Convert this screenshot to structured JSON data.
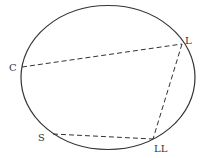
{
  "diagram": {
    "ellipse": {
      "cx": 108,
      "cy": 77.5,
      "rx": 87,
      "ry": 72,
      "stroke": "#333333"
    },
    "points": [
      {
        "id": "C",
        "label": "C",
        "x": 22,
        "y": 67,
        "label_x": 9,
        "label_y": 71
      },
      {
        "id": "L",
        "label": "L",
        "x": 182,
        "y": 44,
        "label_x": 185,
        "label_y": 44
      },
      {
        "id": "S",
        "label": "S",
        "x": 53,
        "y": 134,
        "label_x": 38,
        "label_y": 141
      },
      {
        "id": "LL",
        "label": "LL",
        "x": 153,
        "y": 139,
        "label_x": 154,
        "label_y": 152
      }
    ],
    "dashed_lines": [
      {
        "from": "C",
        "to": "L"
      },
      {
        "from": "L",
        "to": "LL"
      },
      {
        "from": "S",
        "to": "LL"
      }
    ],
    "line_color": "#333333"
  }
}
